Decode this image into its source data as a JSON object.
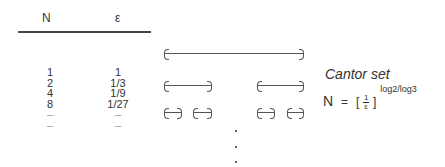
{
  "table": {
    "headers": [
      "N",
      "ε"
    ],
    "rows": [
      {
        "n": "1",
        "eps": "1"
      },
      {
        "n": "2",
        "eps": "1/3"
      },
      {
        "n": "4",
        "eps": "1/9"
      },
      {
        "n": "8",
        "eps": "1/27"
      },
      {
        "n": "–",
        "eps": "–"
      },
      {
        "n": "–",
        "eps": "–"
      }
    ]
  },
  "diagram": {
    "title": "Cantor set",
    "levels": [
      {
        "segments": [
          [
            165,
            303
          ]
        ]
      },
      {
        "segments": [
          [
            165,
            211
          ],
          [
            258,
            303
          ]
        ]
      },
      {
        "segments": [
          [
            165,
            181
          ],
          [
            194,
            211
          ],
          [
            258,
            274
          ],
          [
            288,
            303
          ]
        ]
      }
    ],
    "continuation": "⋮"
  },
  "formula": {
    "lhs": "N",
    "equals": "=",
    "open_bracket": "[",
    "numerator": "1",
    "denominator": "ε",
    "close_bracket": "]",
    "exponent": "log2/log3"
  }
}
